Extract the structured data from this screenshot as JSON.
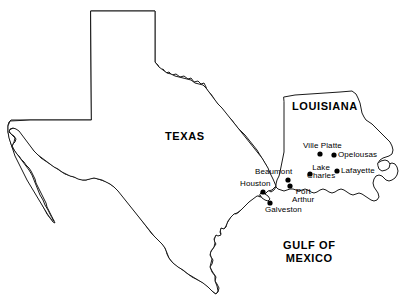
{
  "map": {
    "title": "Texas and Louisiana Gulf Coast Map",
    "background_color": "#ffffff",
    "outline_color": "#1a1a1a",
    "marker_color": "#000000",
    "regions": [
      {
        "id": "texas",
        "label": "TEXAS",
        "x": 165,
        "y": 131
      },
      {
        "id": "louisiana",
        "label": "LOUISIANA",
        "x": 292,
        "y": 101
      }
    ],
    "water_labels": [
      {
        "id": "gulf-of-mexico",
        "line1": "GULF OF",
        "line2": "MEXICO",
        "x": 283,
        "y": 239
      }
    ],
    "cities": [
      {
        "id": "houston",
        "label": "Houston",
        "dot_x": 263,
        "dot_y": 192,
        "label_x": 240,
        "label_y": 180,
        "lines": 1
      },
      {
        "id": "beaumont",
        "label": "Beaumont",
        "dot_x": 288,
        "dot_y": 180,
        "label_x": 255,
        "label_y": 168,
        "lines": 1
      },
      {
        "id": "port-arthur",
        "label": "Port Arthur",
        "line1": "Port",
        "line2": "Arthur",
        "dot_x": 290,
        "dot_y": 186,
        "label_x": 292,
        "label_y": 188,
        "lines": 2
      },
      {
        "id": "galveston",
        "label": "Galveston",
        "dot_x": 270,
        "dot_y": 203,
        "label_x": 265,
        "label_y": 206,
        "lines": 1
      },
      {
        "id": "lake-charles",
        "label": "Lake Charles",
        "line1": "Lake",
        "line2": "Charles",
        "dot_x": 310,
        "dot_y": 174,
        "label_x": 307,
        "label_y": 164,
        "lines": 2
      },
      {
        "id": "ville-platte",
        "label": "Ville Platte",
        "dot_x": 320,
        "dot_y": 154,
        "label_x": 303,
        "label_y": 142,
        "lines": 1
      },
      {
        "id": "opelousas",
        "label": "Opelousas",
        "dot_x": 334,
        "dot_y": 155,
        "label_x": 338,
        "label_y": 151,
        "lines": 1
      },
      {
        "id": "lafayette",
        "label": "Lafayette",
        "dot_x": 337,
        "dot_y": 171,
        "label_x": 341,
        "label_y": 167,
        "lines": 1
      }
    ]
  }
}
